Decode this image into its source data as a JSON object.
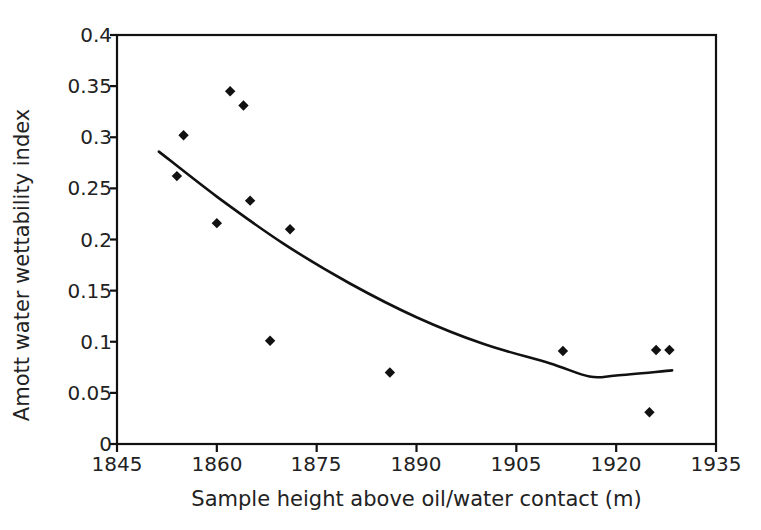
{
  "chart_data": {
    "type": "scatter",
    "title": "",
    "xlabel": "Sample height above oil/water contact (m)",
    "ylabel": "Amott water wettability index",
    "xlim": [
      1845,
      1935
    ],
    "ylim": [
      0,
      0.4
    ],
    "xticks": [
      1845,
      1860,
      1875,
      1890,
      1905,
      1920,
      1935
    ],
    "xtick_labels": [
      "1845",
      "1860",
      "1875",
      "1890",
      "1905",
      "1920",
      "1935"
    ],
    "yticks": [
      0,
      0.05,
      0.1,
      0.15,
      0.2,
      0.25,
      0.3,
      0.35,
      0.4
    ],
    "ytick_labels": [
      "0",
      "0.05",
      "0.1",
      "0.15",
      "0.2",
      "0.25",
      "0.3",
      "0.35",
      "0.4"
    ],
    "grid": false,
    "legend": null,
    "marker": "diamond",
    "marker_color": "#111111",
    "line_color": "#111111",
    "series": [
      {
        "name": "Amott water wettability index",
        "points": [
          {
            "x": 1854,
            "y": 0.262
          },
          {
            "x": 1855,
            "y": 0.302
          },
          {
            "x": 1860,
            "y": 0.216
          },
          {
            "x": 1862,
            "y": 0.345
          },
          {
            "x": 1864,
            "y": 0.331
          },
          {
            "x": 1865,
            "y": 0.238
          },
          {
            "x": 1868,
            "y": 0.101
          },
          {
            "x": 1871,
            "y": 0.21
          },
          {
            "x": 1886,
            "y": 0.07
          },
          {
            "x": 1912,
            "y": 0.091
          },
          {
            "x": 1925,
            "y": 0.031
          },
          {
            "x": 1926,
            "y": 0.092
          },
          {
            "x": 1928,
            "y": 0.092
          }
        ]
      }
    ],
    "trendline": {
      "name": "polynomial-fit",
      "type": "quadratic",
      "x_start": 1851.3,
      "x_end": 1928.4,
      "points": [
        {
          "x": 1851.3,
          "y": 0.286
        },
        {
          "x": 1860,
          "y": 0.242
        },
        {
          "x": 1870,
          "y": 0.196
        },
        {
          "x": 1880,
          "y": 0.157
        },
        {
          "x": 1890,
          "y": 0.124
        },
        {
          "x": 1900,
          "y": 0.098
        },
        {
          "x": 1910,
          "y": 0.079
        },
        {
          "x": 1916,
          "y": 0.066
        },
        {
          "x": 1920,
          "y": 0.067
        },
        {
          "x": 1928.4,
          "y": 0.072
        }
      ]
    }
  }
}
